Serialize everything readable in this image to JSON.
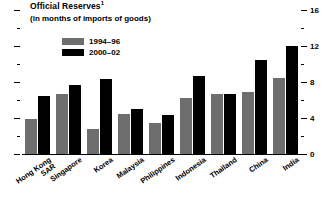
{
  "chart_data": {
    "type": "bar",
    "title": "Official Reserves",
    "title_superscript": "1",
    "subtitle": "(in months of imports of goods)",
    "xlabel": "",
    "ylabel": "",
    "ylim": [
      0,
      16
    ],
    "yticks": [
      0,
      2,
      4,
      6,
      8,
      10,
      12,
      14,
      16
    ],
    "ytick_labels": [
      "0",
      "",
      "4",
      "",
      "8",
      "",
      "12",
      "",
      "16"
    ],
    "grid": false,
    "legend_position": "top-left",
    "axis_side": "right",
    "categories": [
      "Hong Kong SAR",
      "Singapore",
      "Korea",
      "Malaysia",
      "Philippines",
      "Indonesia",
      "Thailand",
      "China",
      "India"
    ],
    "series": [
      {
        "name": "1994–96",
        "color": "#6e6e6e",
        "values": [
          3.9,
          6.7,
          2.8,
          4.4,
          3.4,
          6.2,
          6.7,
          6.9,
          8.4
        ]
      },
      {
        "name": "2000–02",
        "color": "#000000",
        "values": [
          6.4,
          7.7,
          8.3,
          5.0,
          4.3,
          8.7,
          6.7,
          10.4,
          12.0
        ]
      }
    ]
  },
  "legend": {
    "items": [
      {
        "label": "1994–96",
        "color": "#6e6e6e"
      },
      {
        "label": "2000–02",
        "color": "#000000"
      }
    ]
  },
  "axis": {
    "labels": [
      "16",
      "12",
      "8",
      "4",
      "0"
    ]
  }
}
